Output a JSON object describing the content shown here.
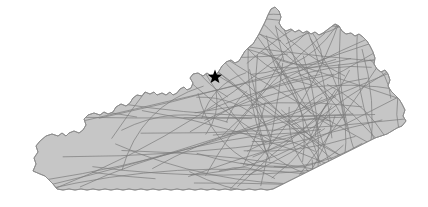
{
  "figure": {
    "type": "map",
    "width": 428,
    "height": 207,
    "background_color": "#ffffff"
  },
  "region": {
    "name": "Kentucky",
    "fill_color": "#c6c6c6",
    "border_color": "#8c8c8c",
    "border_width": 0.9,
    "bounds": {
      "left": 33,
      "top": 7,
      "right": 406,
      "bottom": 191
    },
    "outline_path": "M 33 171 L 36 164 L 34 158 L 38 152 L 36 146 L 40 141 L 46 136 L 52 134 L 58 136 L 62 133 L 66 136 L 69 133 L 74 131 L 79 133 L 83 130 L 86 125 L 84 119 L 88 115 L 94 113 L 100 115 L 104 112 L 108 114 L 113 112 L 116 107 L 121 104 L 126 106 L 130 103 L 133 98 L 137 95 L 142 96 L 145 92 L 150 94 L 154 92 L 157 95 L 162 93 L 166 95 L 170 92 L 173 95 L 177 93 L 180 89 L 184 87 L 187 90 L 191 88 L 193 83 L 190 78 L 193 74 L 198 73 L 203 76 L 207 73 L 211 76 L 216 75 L 219 71 L 222 66 L 226 62 L 231 60 L 235 63 L 239 61 L 242 56 L 245 51 L 249 47 L 253 44 L 256 39 L 259 34 L 262 28 L 265 22 L 268 15 L 271 9 L 275 7 L 279 11 L 281 17 L 279 23 L 282 28 L 286 31 L 291 29 L 295 32 L 299 30 L 303 33 L 307 31 L 311 34 L 315 32 L 319 35 L 323 33 L 327 30 L 331 27 L 335 24 L 339 26 L 342 31 L 346 34 L 351 33 L 355 36 L 359 34 L 363 37 L 367 41 L 370 46 L 373 52 L 375 58 L 374 64 L 377 69 L 381 72 L 385 70 L 388 74 L 390 80 L 388 86 L 391 91 L 395 95 L 399 99 L 402 104 L 405 110 L 403 116 L 406 121 L 402 126 L 397 128 L 392 131 L 387 134 L 381 136 L 375 138 L 369 141 L 363 144 L 357 147 L 351 150 L 345 153 L 339 156 L 333 159 L 327 162 L 321 165 L 315 168 L 309 171 L 303 174 L 297 177 L 291 180 L 285 183 L 279 186 L 273 189 L 267 190 L 261 189 L 255 190 L 249 189 L 243 190 L 237 189 L 231 190 L 225 189 L 219 190 L 213 189 L 207 190 L 201 189 L 195 190 L 189 189 L 183 190 L 177 189 L 171 190 L 165 189 L 159 190 L 153 189 L 147 190 L 141 189 L 135 190 L 129 189 L 123 190 L 117 189 L 111 190 L 105 189 L 99 190 L 93 189 L 87 190 L 81 189 L 75 190 L 69 189 L 63 190 L 57 189 L 53 184 L 49 180 L 45 176 L 40 174 Z"
  },
  "routes": {
    "line_color": "#7d7d7d",
    "line_width": 0.85,
    "line_opacity": 0.85,
    "count": 118,
    "description": "Dense overlapping great-circle style route arcs across the state, heaviest in the eastern half"
  },
  "marker": {
    "name": "city-marker",
    "shape": "star",
    "color": "#000000",
    "x": 215,
    "y": 77,
    "size": 15,
    "points": 5
  },
  "seed": 20240517
}
